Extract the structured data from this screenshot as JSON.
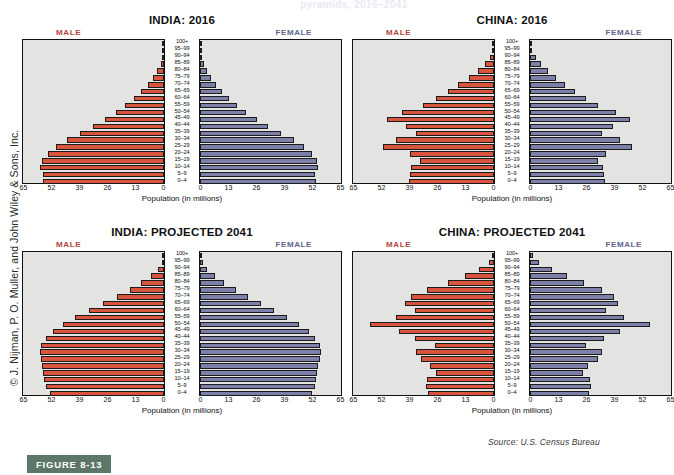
{
  "figure": {
    "badge": "FIGURE 8-13",
    "source": "Source: U.S. Census Bureau",
    "copyright": "© J. Nijman, P. O. Muller, and John Wiley & Sons, Inc.",
    "ghost_text": "pyramids, 2016–2041"
  },
  "colors": {
    "male_bar": "#d8543d",
    "female_bar": "#7c80a8",
    "plot_background": "#e3e3e1",
    "male_label": "#b4473a",
    "female_label": "#62658c",
    "badge_background": "#5d7668"
  },
  "common": {
    "male_label": "MALE",
    "female_label": "FEMALE",
    "axis_title": "Population (in millions)",
    "age_groups": [
      "100+",
      "95–99",
      "90–94",
      "85–89",
      "80–84",
      "75–79",
      "70–74",
      "65–69",
      "60–64",
      "55–59",
      "50–54",
      "45–49",
      "40–44",
      "35–39",
      "30–34",
      "25–29",
      "20–24",
      "15–19",
      "10–14",
      "5–9",
      "0–4"
    ],
    "left_ticks": [
      "65",
      "52",
      "39",
      "26",
      "13",
      "0"
    ],
    "right_ticks": [
      "0",
      "13",
      "26",
      "39",
      "52",
      "65"
    ],
    "axis_max": 65
  },
  "chart_data": [
    {
      "type": "bar",
      "title": "INDIA: 2016",
      "xlabel": "Population (in millions)",
      "ylabel": "",
      "xlim": [
        0,
        65
      ],
      "grid": false,
      "legend_position": "top",
      "categories": [
        "100+",
        "95–99",
        "90–94",
        "85–89",
        "80–84",
        "75–79",
        "70–74",
        "65–69",
        "60–64",
        "55–59",
        "50–54",
        "45–49",
        "40–44",
        "35–39",
        "30–34",
        "25–29",
        "20–24",
        "15–19",
        "10–14",
        "5–9",
        "0–4"
      ],
      "series": [
        {
          "name": "MALE",
          "values": [
            0.1,
            0.3,
            0.8,
            1.6,
            3.1,
            5.0,
            7.5,
            10.5,
            14.0,
            18.0,
            22.5,
            27.5,
            33.0,
            39.0,
            45.0,
            50.0,
            54.0,
            56.5,
            57.5,
            56.0,
            56.0
          ]
        },
        {
          "name": "FEMALE",
          "values": [
            0.1,
            0.4,
            1.0,
            1.9,
            3.4,
            5.2,
            7.4,
            10.3,
            13.6,
            17.3,
            21.5,
            26.3,
            31.5,
            37.5,
            43.5,
            48.5,
            52.0,
            54.5,
            55.0,
            53.5,
            54.0
          ]
        }
      ]
    },
    {
      "type": "bar",
      "title": "CHINA: 2016",
      "xlabel": "Population (in millions)",
      "ylabel": "",
      "xlim": [
        0,
        65
      ],
      "grid": false,
      "legend_position": "top",
      "categories": [
        "100+",
        "95–99",
        "90–94",
        "85–89",
        "80–84",
        "75–79",
        "70–74",
        "65–69",
        "60–64",
        "55–59",
        "50–54",
        "45–49",
        "40–44",
        "35–39",
        "30–34",
        "25–29",
        "20–24",
        "15–19",
        "10–14",
        "5–9",
        "0–4"
      ],
      "series": [
        {
          "name": "MALE",
          "values": [
            0.1,
            0.5,
            1.7,
            4.0,
            7.6,
            11.7,
            16.5,
            21.5,
            27.0,
            33.0,
            42.5,
            49.5,
            41.0,
            36.0,
            45.5,
            51.5,
            39.0,
            34.5,
            38.5,
            39.0,
            39.5
          ]
        },
        {
          "name": "FEMALE",
          "values": [
            0.2,
            0.9,
            2.6,
            5.2,
            8.5,
            12.3,
            16.3,
            21.0,
            26.0,
            31.5,
            40.0,
            46.5,
            38.5,
            33.5,
            42.0,
            47.5,
            35.5,
            31.5,
            34.0,
            34.5,
            35.0
          ]
        }
      ]
    },
    {
      "type": "bar",
      "title": "INDIA: PROJECTED 2041",
      "xlabel": "Population (in millions)",
      "ylabel": "",
      "xlim": [
        0,
        65
      ],
      "grid": false,
      "legend_position": "top",
      "categories": [
        "100+",
        "95–99",
        "90–94",
        "85–89",
        "80–84",
        "75–79",
        "70–74",
        "65–69",
        "60–64",
        "55–59",
        "50–54",
        "45–49",
        "40–44",
        "35–39",
        "30–34",
        "25–29",
        "20–24",
        "15–19",
        "10–14",
        "5–9",
        "0–4"
      ],
      "series": [
        {
          "name": "MALE",
          "values": [
            0.3,
            1.1,
            2.8,
            6.0,
            10.5,
            16.0,
            22.0,
            28.5,
            35.0,
            41.5,
            47.0,
            51.5,
            55.0,
            57.0,
            57.5,
            57.0,
            56.5,
            56.0,
            55.5,
            55.0,
            53.0
          ]
        },
        {
          "name": "FEMALE",
          "values": [
            0.4,
            1.4,
            3.4,
            6.8,
            11.3,
            16.8,
            22.5,
            28.5,
            34.5,
            40.5,
            46.0,
            50.5,
            53.5,
            55.5,
            56.0,
            55.5,
            55.0,
            54.5,
            54.0,
            53.5,
            52.0
          ]
        }
      ]
    },
    {
      "type": "bar",
      "title": "CHINA: PROJECTED 2041",
      "xlabel": "Population (in millions)",
      "ylabel": "",
      "xlim": [
        0,
        65
      ],
      "grid": false,
      "legend_position": "top",
      "categories": [
        "100+",
        "95–99",
        "90–94",
        "85–89",
        "80–84",
        "75–79",
        "70–74",
        "65–69",
        "60–64",
        "55–59",
        "50–54",
        "45–49",
        "40–44",
        "35–39",
        "30–34",
        "25–29",
        "20–24",
        "15–19",
        "10–14",
        "5–9",
        "0–4"
      ],
      "series": [
        {
          "name": "MALE",
          "values": [
            0.6,
            2.4,
            7.0,
            13.5,
            21.5,
            31.0,
            38.5,
            41.5,
            36.5,
            45.5,
            57.5,
            44.0,
            36.5,
            27.5,
            36.0,
            34.0,
            29.5,
            27.0,
            31.0,
            31.5,
            30.5
          ]
        },
        {
          "name": "FEMALE",
          "values": [
            1.3,
            4.3,
            10.0,
            17.0,
            25.0,
            33.5,
            39.0,
            41.0,
            35.5,
            43.5,
            55.5,
            42.0,
            34.5,
            26.0,
            33.5,
            31.5,
            27.0,
            24.5,
            28.0,
            28.5,
            27.5
          ]
        }
      ]
    }
  ]
}
